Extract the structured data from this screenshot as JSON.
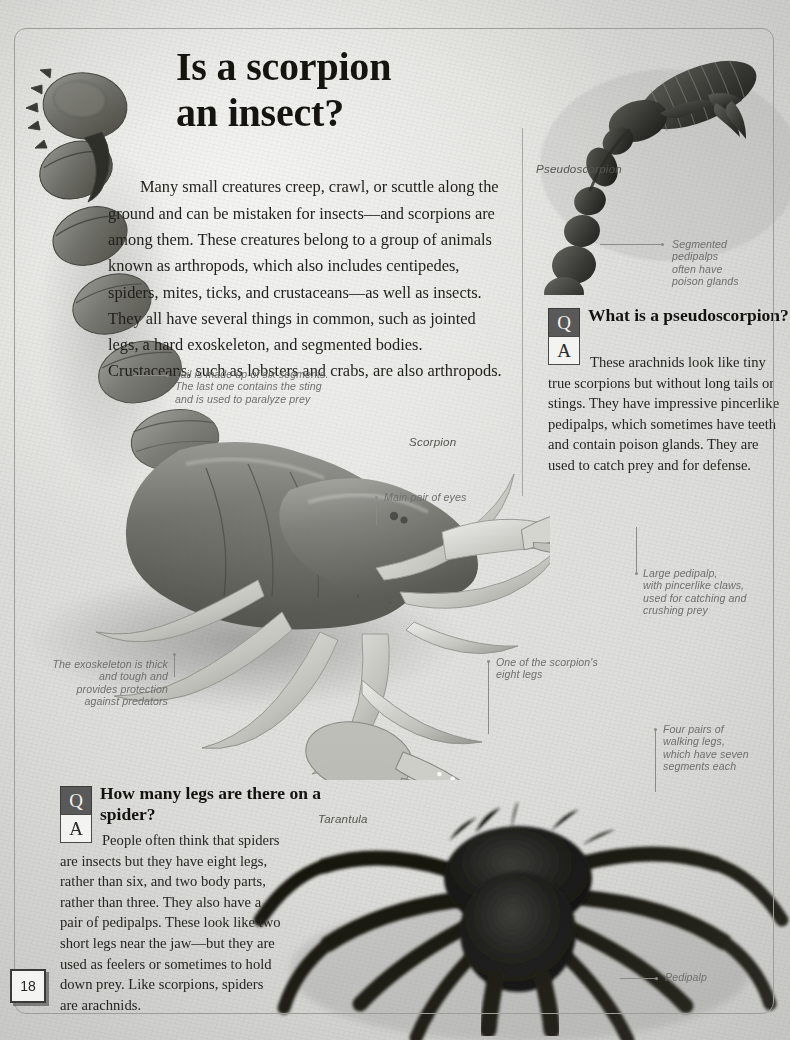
{
  "page": {
    "number": "18",
    "title_line1": "Is a scorpion",
    "title_line2": "an insect?",
    "intro": "Many small creatures creep, crawl, or scuttle along the ground and can be mistaken for insects—and scorpions are among them. These creatures belong to a group of animals known as arthropods, which also includes centipedes, spiders, mites, ticks, and crustaceans—as well as insects. They all have several things in common, such as jointed legs, a hard exoskeleton, and segmented bodies. Crustaceans, such as lobsters and crabs, are also arthropods."
  },
  "qa": [
    {
      "id": "pseudoscorpion",
      "q_letter": "Q",
      "a_letter": "A",
      "question": "What is a pseudoscorpion?",
      "answer": "These arachnids look like tiny true scorpions but without long tails or stings. They have impressive pincerlike pedipalps, which sometimes have teeth and contain poison glands. They are used to catch prey and for defense."
    },
    {
      "id": "spider-legs",
      "q_letter": "Q",
      "a_letter": "A",
      "question": "How many legs are there on a spider?",
      "answer": "People often think that spiders are insects but they have eight legs, rather than six, and two body parts, rather than three. They also have a pair of pedipalps. These look like two short legs near the jaw—but they are used as feelers or sometimes to hold down prey. Like scorpions, spiders are arachnids."
    }
  ],
  "specimens": {
    "pseudoscorpion": "Pseudoscorpion",
    "scorpion": "Scorpion",
    "tarantula": "Tarantula"
  },
  "captions": {
    "segmented_pedipalps": "Segmented\npedipalps\noften have\npoison glands",
    "tail": "Tail is made up of six segments.\nThe last one contains the sting\nand is used to paralyze prey",
    "eyes": "Main pair of eyes",
    "large_pedipalp": "Large pedipalp,\nwith pincerlike claws,\nused for catching and\ncrushing prey",
    "exoskeleton": "The exoskeleton is thick\nand tough and\nprovides protection\nagainst predators",
    "one_leg": "One of the scorpion's\neight legs",
    "four_pairs": "Four pairs of\nwalking legs,\nwhich have seven\nsegments each",
    "pedipalp": "Pedipalp"
  },
  "colors": {
    "ink": "#15140f",
    "caption": "#6f6f6d",
    "q_box_bg": "#595959",
    "a_box_bg": "#f3f3f1",
    "frame": "#9d9d9a"
  }
}
